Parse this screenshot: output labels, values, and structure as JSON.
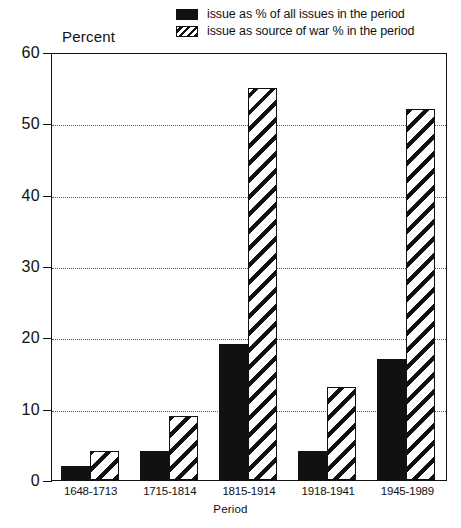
{
  "chart_data": {
    "type": "bar",
    "title": "",
    "xlabel": "Period",
    "ylabel": "Percent",
    "ylim": [
      0,
      60
    ],
    "yticks": [
      0,
      10,
      20,
      30,
      40,
      50,
      60
    ],
    "grid": true,
    "legend_position": "top-right",
    "categories": [
      "1648-1713",
      "1715-1814",
      "1815-1914",
      "1918-1941",
      "1945-1989"
    ],
    "series": [
      {
        "name": "issue as % of all issues in the period",
        "style": "solid-black",
        "values": [
          2,
          4,
          19,
          4,
          17
        ]
      },
      {
        "name": "issue as source of war % in the period",
        "style": "diagonal-hatch",
        "values": [
          4,
          9,
          55,
          13,
          52
        ]
      }
    ]
  },
  "legend": {
    "items": [
      {
        "label": "issue as % of all issues in the period",
        "swatch": "solid-swatch"
      },
      {
        "label": "issue as source of war % in the period",
        "swatch": "hatch-swatch"
      }
    ]
  },
  "axes": {
    "y_title": "Percent",
    "x_title": "Period",
    "y_tick_labels": [
      "60",
      "50",
      "40",
      "30",
      "20",
      "10",
      "0"
    ],
    "x_tick_labels": [
      "1648-1713",
      "1715-1814",
      "1815-1914",
      "1918-1941",
      "1945-1989"
    ]
  },
  "colors": {
    "ink": "#111111",
    "background": "#ffffff",
    "grid": "#5a5a5a"
  }
}
